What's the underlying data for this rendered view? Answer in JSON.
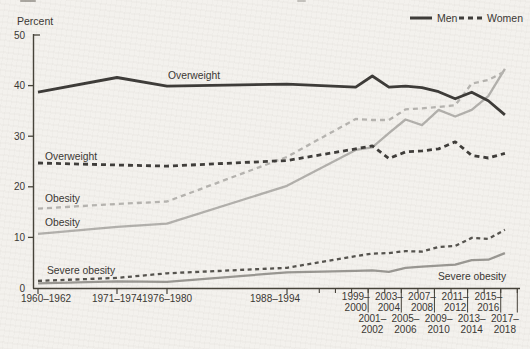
{
  "chart_data": {
    "type": "line",
    "ylabel": "Percent",
    "ylim": [
      0,
      50
    ],
    "yticks": [
      0,
      10,
      20,
      30,
      40,
      50
    ],
    "grid": false,
    "surveys": [
      "1960–1962",
      "1971–1974",
      "1976–1980",
      "1988–1994",
      "1999–2000",
      "2001–2002",
      "2003–2004",
      "2005–2006",
      "2007–2008",
      "2009–2010",
      "2011–2012",
      "2013–2014",
      "2015–2016",
      "2017–2018"
    ],
    "survey_mid_years": [
      1961,
      1972.5,
      1978,
      1991,
      1999.5,
      2001.5,
      2003.5,
      2005.5,
      2007.5,
      2009.5,
      2011.5,
      2013.5,
      2015.5,
      2017.5
    ],
    "legend": {
      "position": "top-right",
      "items": [
        {
          "label": "Men",
          "line_style": "solid"
        },
        {
          "label": "Women",
          "line_style": "dashed"
        }
      ]
    },
    "series": [
      {
        "key": "obesity-men",
        "sex": "Men",
        "measure": "Obesity",
        "line_style": "solid",
        "color": "#b2b0ac",
        "values": [
          10.7,
          12.1,
          12.7,
          20.2,
          27.3,
          27.8,
          30.6,
          33.3,
          32.2,
          35.2,
          33.9,
          35.2,
          37.9,
          43.3
        ]
      },
      {
        "key": "obesity-women",
        "sex": "Women",
        "measure": "Obesity",
        "line_style": "dashed",
        "color": "#b6b4b0",
        "values": [
          15.7,
          16.6,
          17.1,
          25.9,
          33.4,
          33.2,
          33.2,
          35.3,
          35.5,
          35.8,
          36.1,
          40.4,
          41.1,
          42.8
        ]
      },
      {
        "key": "severe-obesity-men",
        "sex": "Men",
        "measure": "Severe obesity",
        "line_style": "solid",
        "color": "#999792",
        "values": [
          0.9,
          1.3,
          1.2,
          3.1,
          3.4,
          3.5,
          3.2,
          4.0,
          4.2,
          4.4,
          4.6,
          5.5,
          5.6,
          6.9
        ]
      },
      {
        "key": "severe-obesity-women",
        "sex": "Women",
        "measure": "Severe obesity",
        "line_style": "dashed",
        "color": "#55534e",
        "values": [
          1.4,
          2.0,
          2.9,
          4.0,
          6.3,
          6.8,
          6.9,
          7.3,
          7.2,
          8.1,
          8.3,
          9.9,
          9.7,
          11.5
        ]
      },
      {
        "key": "overweight-men",
        "sex": "Men",
        "measure": "Overweight",
        "line_style": "solid",
        "color": "#3d3b38",
        "values": [
          38.7,
          41.6,
          39.9,
          40.3,
          39.7,
          41.9,
          39.7,
          39.9,
          39.6,
          38.8,
          37.4,
          38.7,
          37.0,
          34.2
        ]
      },
      {
        "key": "overweight-women",
        "sex": "Women",
        "measure": "Overweight",
        "line_style": "dashed",
        "color": "#3f3d3a",
        "values": [
          24.7,
          24.3,
          24.1,
          25.2,
          27.5,
          28.1,
          25.6,
          26.9,
          27.1,
          27.5,
          28.9,
          26.2,
          25.7,
          26.6
        ]
      }
    ],
    "annotations": [
      {
        "text": "Overweight",
        "series": "overweight-men"
      },
      {
        "text": "Overweight",
        "series": "overweight-women"
      },
      {
        "text": "Obesity",
        "series": "obesity-women"
      },
      {
        "text": "Obesity",
        "series": "obesity-men"
      },
      {
        "text": "Severe obesity",
        "series": "severe-obesity-women"
      },
      {
        "text": "Severe obesity",
        "series": "severe-obesity-men"
      }
    ],
    "x_axis": {
      "extra_tick_years": [
        1995,
        1997,
        1999,
        2001,
        2003,
        2005,
        2007,
        2009,
        2011,
        2013,
        2015,
        2017,
        2019
      ],
      "separator_years": [
        2001,
        2005,
        2009,
        2013,
        2017,
        2019
      ]
    },
    "colors": {
      "axis": "#454239",
      "text": "#3a3733",
      "background": "#f3f1ed"
    }
  }
}
